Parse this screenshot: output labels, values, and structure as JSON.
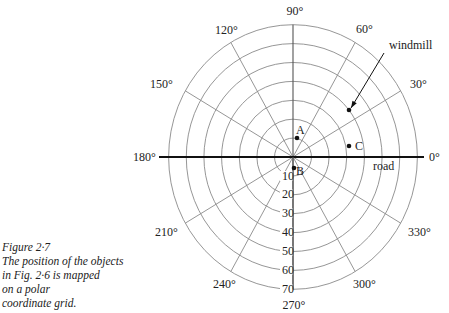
{
  "figure": {
    "caption": {
      "title": "Figure 2·7",
      "lines": [
        "The position of the objects",
        "in Fig. 2·6 is mapped",
        "on a polar",
        "coordinate grid."
      ]
    },
    "grid": {
      "center": [
        293,
        157
      ],
      "ring_step_x": 18.2,
      "ring_step_y": 18.9,
      "rings": [
        10,
        20,
        30,
        40,
        50,
        60,
        70
      ],
      "spoke_angles": [
        30,
        60,
        90,
        120,
        150,
        210,
        240,
        270,
        300,
        330
      ],
      "grid_color": "#8a8a8a",
      "axis_color": "#111111"
    },
    "angle_labels": [
      {
        "text": "0°",
        "x": 429,
        "y": 161,
        "anchor": "start"
      },
      {
        "text": "30°",
        "x": 410,
        "y": 88,
        "anchor": "start"
      },
      {
        "text": "60°",
        "x": 356,
        "y": 33,
        "anchor": "start"
      },
      {
        "text": "90°",
        "x": 295,
        "y": 15,
        "anchor": "middle"
      },
      {
        "text": "120°",
        "x": 215,
        "y": 34,
        "anchor": "start"
      },
      {
        "text": "150°",
        "x": 150,
        "y": 88,
        "anchor": "start"
      },
      {
        "text": "180°",
        "x": 133,
        "y": 161,
        "anchor": "start"
      },
      {
        "text": "210°",
        "x": 155,
        "y": 236,
        "anchor": "start"
      },
      {
        "text": "240°",
        "x": 213,
        "y": 288,
        "anchor": "start"
      },
      {
        "text": "270°",
        "x": 294,
        "y": 309,
        "anchor": "middle"
      },
      {
        "text": "300°",
        "x": 353,
        "y": 288,
        "anchor": "start"
      },
      {
        "text": "330°",
        "x": 408,
        "y": 236,
        "anchor": "start"
      }
    ],
    "radial_labels": [
      {
        "text": "10",
        "y": 180
      },
      {
        "text": "20",
        "y": 198
      },
      {
        "text": "30",
        "y": 217
      },
      {
        "text": "40",
        "y": 236
      },
      {
        "text": "50",
        "y": 255
      },
      {
        "text": "60",
        "y": 274
      },
      {
        "text": "70",
        "y": 293
      }
    ],
    "road": {
      "label": "road",
      "x1": 159,
      "x2": 424,
      "label_x": 373,
      "label_y": 170
    },
    "points": [
      {
        "name": "A",
        "x": 297,
        "y": 138,
        "label_x": 296,
        "label_y": 134
      },
      {
        "name": "B",
        "x": 294,
        "y": 168,
        "label_x": 296,
        "label_y": 175
      },
      {
        "name": "C",
        "x": 349,
        "y": 146,
        "label_x": 355,
        "label_y": 150
      },
      {
        "name": "windmill",
        "x": 349,
        "y": 110
      }
    ],
    "windmill_annotation": {
      "label": "windmill",
      "label_x": 389,
      "label_y": 49,
      "arrow_from": [
        384,
        53
      ],
      "arrow_to": [
        351,
        108
      ]
    }
  }
}
